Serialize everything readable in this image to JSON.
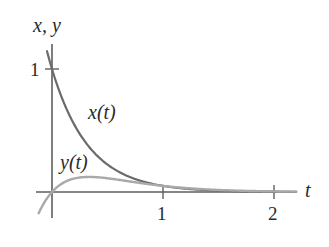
{
  "chart_data": {
    "type": "line",
    "title": "",
    "xlabel": "t",
    "ylabel": "x, y",
    "xlim": [
      -0.05,
      2.2
    ],
    "ylim": [
      -0.2,
      1.2
    ],
    "x_ticks": [
      1,
      2
    ],
    "x_tick_labels": [
      "1",
      "2"
    ],
    "y_ticks": [
      1
    ],
    "y_tick_labels": [
      "1"
    ],
    "grid": false,
    "legend": "none (curves labeled inline)",
    "series": [
      {
        "name": "x(t)",
        "label": "x(t)",
        "formula": "e^(-3t)",
        "color": "#6b6b6b",
        "t": [
          -0.04,
          0,
          0.1,
          0.2,
          0.3,
          0.4,
          0.5,
          0.6,
          0.8,
          1.0,
          1.25,
          1.5,
          1.75,
          2.0,
          2.2
        ],
        "values": [
          1.13,
          1.0,
          0.741,
          0.549,
          0.407,
          0.301,
          0.223,
          0.165,
          0.091,
          0.05,
          0.024,
          0.011,
          0.005,
          0.002,
          0.001
        ]
      },
      {
        "name": "y(t)",
        "label": "y(t)",
        "formula": "t·e^(-3t)",
        "color": "#a9a9a9",
        "t": [
          -0.12,
          -0.06,
          0,
          0.1,
          0.2,
          0.333,
          0.5,
          0.7,
          1.0,
          1.25,
          1.5,
          1.75,
          2.0,
          2.2
        ],
        "values": [
          -0.172,
          -0.072,
          0.0,
          0.074,
          0.11,
          0.123,
          0.112,
          0.086,
          0.05,
          0.029,
          0.017,
          0.009,
          0.005,
          0.003
        ]
      }
    ],
    "annotations": [
      {
        "text": "x(t)",
        "near": "x(t) curve, t≈0.4"
      },
      {
        "text": "y(t)",
        "near": "y(t) curve peak, t≈0.3"
      }
    ]
  },
  "labels": {
    "y_axis": "x, y",
    "x_axis": "t",
    "y_tick_1": "1",
    "x_tick_1": "1",
    "x_tick_2": "2",
    "curve_x": "x(t)",
    "curve_y": "y(t)"
  },
  "layout": {
    "origin_px": [
      52,
      192
    ],
    "px_per_t": 111,
    "px_per_y": 123,
    "axis_color": "#5e5e5e"
  }
}
